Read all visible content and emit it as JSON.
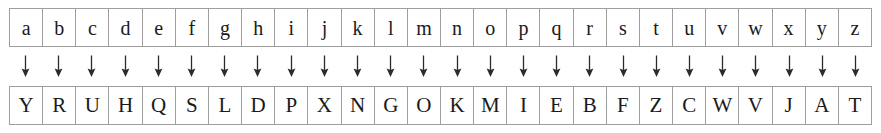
{
  "cipher_table": {
    "plaintext_row": {
      "label": "plaintext alphabet",
      "letters": [
        "a",
        "b",
        "c",
        "d",
        "e",
        "f",
        "g",
        "h",
        "i",
        "j",
        "k",
        "l",
        "m",
        "n",
        "o",
        "p",
        "q",
        "r",
        "s",
        "t",
        "u",
        "v",
        "w",
        "x",
        "y",
        "z"
      ]
    },
    "ciphertext_row": {
      "label": "ciphertext alphabet",
      "letters": [
        "Y",
        "R",
        "U",
        "H",
        "Q",
        "S",
        "L",
        "D",
        "P",
        "X",
        "N",
        "G",
        "O",
        "K",
        "M",
        "I",
        "E",
        "B",
        "F",
        "Z",
        "C",
        "W",
        "V",
        "J",
        "A",
        "T"
      ]
    },
    "arrow_row": {
      "icon": "arrow-down-icon",
      "glyph": "↓",
      "count": 26
    },
    "colors": {
      "border": "#9e9e9e",
      "text": "#1a1a1a",
      "background": "#ffffff",
      "arrow": "#2b2b2b"
    }
  }
}
